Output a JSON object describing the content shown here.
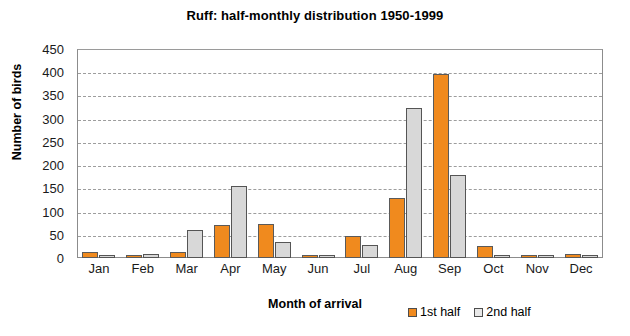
{
  "chart_data": {
    "type": "bar",
    "title": "Ruff: half-monthly distribution 1950-1999",
    "xlabel": "Month of arrival",
    "ylabel": "Number of birds",
    "categories": [
      "Jan",
      "Feb",
      "Mar",
      "Apr",
      "May",
      "Jun",
      "Jul",
      "Aug",
      "Sep",
      "Oct",
      "Nov",
      "Dec"
    ],
    "series": [
      {
        "name": "1st half",
        "color": "#f08a1e",
        "values": [
          13,
          1,
          13,
          72,
          73,
          6,
          48,
          130,
          396,
          26,
          2,
          8
        ]
      },
      {
        "name": "2nd half",
        "color": "#d8d8d8",
        "values": [
          2,
          8,
          60,
          154,
          35,
          5,
          29,
          323,
          179,
          4,
          3,
          5
        ]
      }
    ],
    "ylim": [
      0,
      450
    ],
    "yticks": [
      0,
      50,
      100,
      150,
      200,
      250,
      300,
      350,
      400,
      450
    ],
    "grid": true,
    "legend_position": "bottom-right"
  }
}
